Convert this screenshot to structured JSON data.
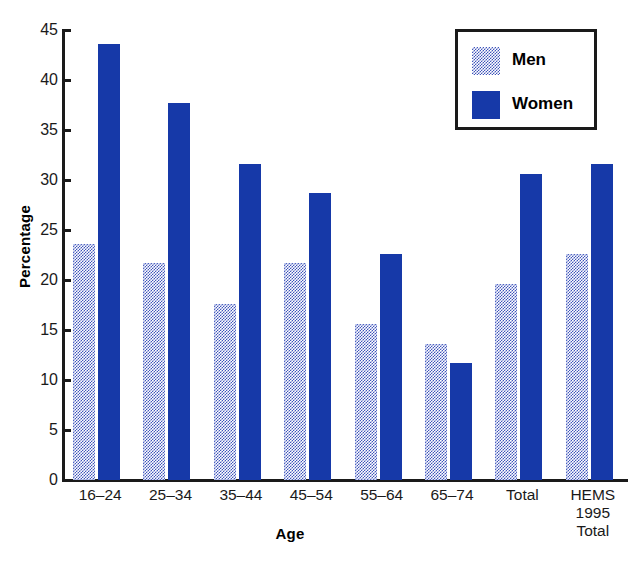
{
  "chart_data": {
    "type": "bar",
    "title": "",
    "xlabel": "Age",
    "ylabel": "Percentage",
    "ylim": [
      0,
      45
    ],
    "yticks": [
      0,
      5,
      10,
      15,
      20,
      25,
      30,
      35,
      40,
      45
    ],
    "grid": false,
    "legend_position": "top-right",
    "categories": [
      "16–24",
      "25–34",
      "35–44",
      "45–54",
      "55–64",
      "65–74",
      "Total",
      "HEMS 1995 Total"
    ],
    "category_lines": [
      [
        "16–24"
      ],
      [
        "25–34"
      ],
      [
        "35–44"
      ],
      [
        "45–54"
      ],
      [
        "55–64"
      ],
      [
        "65–74"
      ],
      [
        "Total"
      ],
      [
        "HEMS",
        "1995",
        "Total"
      ]
    ],
    "series": [
      {
        "name": "Men",
        "color": "#7b8bd4",
        "pattern": "dotted-stipple",
        "values": [
          23.6,
          21.7,
          17.6,
          21.7,
          15.6,
          13.6,
          19.6,
          22.6
        ]
      },
      {
        "name": "Women",
        "color": "#1639a8",
        "pattern": "solid",
        "values": [
          43.6,
          37.7,
          31.6,
          28.7,
          22.6,
          11.7,
          30.6,
          31.6
        ]
      }
    ]
  },
  "legend": {
    "items": [
      {
        "label": "Men"
      },
      {
        "label": "Women"
      }
    ]
  },
  "axes": {
    "y_title": "Percentage",
    "x_title": "Age",
    "y_tick_labels": [
      "0",
      "5",
      "10",
      "15",
      "20",
      "25",
      "30",
      "35",
      "40",
      "45"
    ]
  }
}
